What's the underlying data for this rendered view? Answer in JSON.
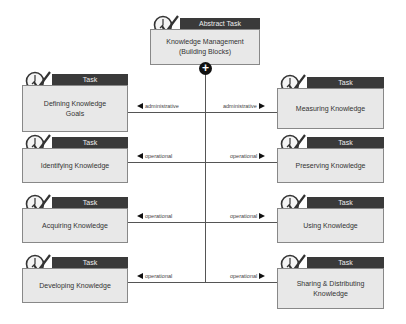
{
  "root": {
    "header": "Abstract Task",
    "title": "Knowledge Management\n(Building Blocks)"
  },
  "left": [
    {
      "header": "Task",
      "title": "Defining Knowledge\nGoals",
      "relation": "administrative"
    },
    {
      "header": "Task",
      "title": "Identifying Knowledge",
      "relation": "operational"
    },
    {
      "header": "Task",
      "title": "Acquiring Knowledge",
      "relation": "operational"
    },
    {
      "header": "Task",
      "title": "Developing Knowledge",
      "relation": "operational"
    }
  ],
  "right": [
    {
      "header": "Task",
      "title": "Measuring Knowledge",
      "relation": "administrative"
    },
    {
      "header": "Task",
      "title": "Preserving Knowledge",
      "relation": "operational"
    },
    {
      "header": "Task",
      "title": "Using Knowledge",
      "relation": "operational"
    },
    {
      "header": "Task",
      "title": "Sharing & Distributing\nKnowledge",
      "relation": "operational"
    }
  ],
  "connector_icon": "plus-circle-icon",
  "task_icon": "clock-check-icon"
}
